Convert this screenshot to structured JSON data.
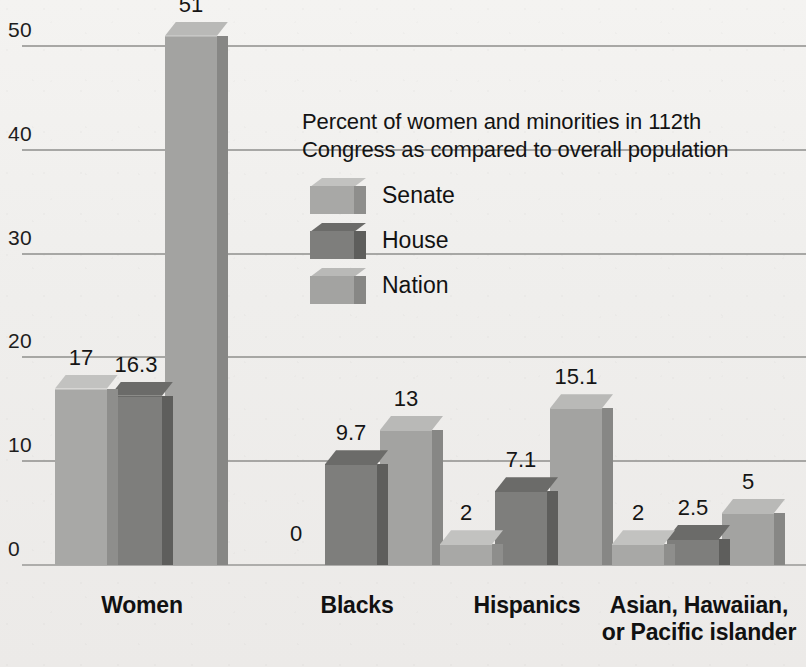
{
  "chart_data": {
    "type": "bar",
    "title": "",
    "xlabel": "",
    "ylabel": "",
    "ylim": [
      0,
      55
    ],
    "grid": true,
    "legend_position": "inside-upper-center",
    "annotation": "Percent of women and minorities in  112th\nCongress as compared to overall population",
    "yticks": [
      "0",
      "10",
      "20",
      "30",
      "40",
      "50"
    ],
    "ytick_values": [
      0,
      10,
      20,
      30,
      40,
      50
    ],
    "categories": [
      "Women",
      "Blacks",
      "Hispanics",
      "Asian, Hawaiian, or Pacific islander"
    ],
    "categories_display": [
      [
        "Women"
      ],
      [
        "Blacks"
      ],
      [
        "Hispanics"
      ],
      [
        "Asian, Hawaiian,",
        "or Pacific islander"
      ]
    ],
    "series": [
      {
        "name": "Senate",
        "values": [
          17,
          0,
          2,
          2
        ],
        "labels": [
          "17",
          "0",
          "2",
          "2"
        ],
        "color": "#a8a8a6",
        "color_top": "#c2c2c0",
        "color_side": "#8e8e8c"
      },
      {
        "name": "House",
        "values": [
          16.3,
          9.7,
          7.1,
          2.5
        ],
        "labels": [
          "16.3",
          "9.7",
          "7.1",
          "2.5"
        ],
        "color": "#7e7e7c",
        "color_top": "#6b6b69",
        "color_side": "#5e5e5c"
      },
      {
        "name": "Nation",
        "values": [
          51,
          13,
          15.1,
          5
        ],
        "labels": [
          "51",
          "13",
          "15.1",
          "5"
        ],
        "color": "#a3a3a1",
        "color_top": "#b9b9b7",
        "color_side": "#878785"
      }
    ]
  },
  "legend": {
    "caption": "Percent of women and minorities in  112th\nCongress as compared to overall population",
    "items": [
      {
        "label": "Senate"
      },
      {
        "label": "House"
      },
      {
        "label": "Nation"
      }
    ]
  },
  "colors": {
    "background": "#f2f1ef",
    "gridline": "#9a9a98",
    "text": "#1c1c1c",
    "senate": "#a8a8a6",
    "house": "#7e7e7c",
    "nation": "#a3a3a1"
  }
}
